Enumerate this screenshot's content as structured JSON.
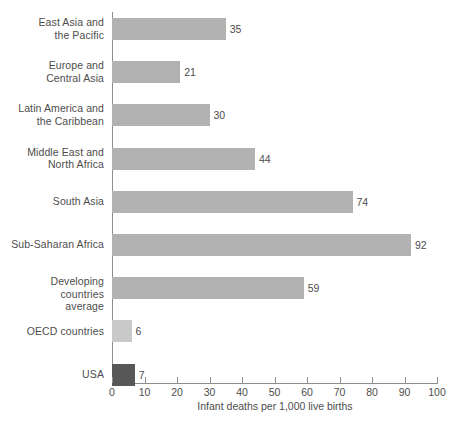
{
  "chart_data": {
    "type": "bar",
    "orientation": "horizontal",
    "title": "",
    "xlabel": "Infant deaths per 1,000 live births",
    "ylabel": "",
    "xlim": [
      0,
      100
    ],
    "xticks": [
      0,
      10,
      20,
      30,
      40,
      50,
      60,
      70,
      80,
      90,
      100
    ],
    "xtick_labels": [
      "0",
      "10",
      "20",
      "30",
      "40",
      "50",
      "60",
      "70",
      "80",
      "90",
      "100"
    ],
    "grid": false,
    "legend": null,
    "categories": [
      "East Asia and the Pacific",
      "Europe and Central Asia",
      "Latin America and the Caribbean",
      "Middle East and North Africa",
      "South Asia",
      "Sub-Saharan Africa",
      "Developing countries average",
      "OECD countries",
      "USA"
    ],
    "values": [
      35,
      21,
      30,
      44,
      74,
      92,
      59,
      6,
      7
    ],
    "value_labels": [
      "35",
      "21",
      "30",
      "44",
      "74",
      "92",
      "59",
      "6",
      "7"
    ],
    "bars": [
      {
        "label_line1": "East Asia and",
        "label_line2": "the Pacific",
        "value": 35,
        "value_label": "35",
        "color": "#b2b2b2"
      },
      {
        "label_line1": "Europe and",
        "label_line2": "Central Asia",
        "value": 21,
        "value_label": "21",
        "color": "#b2b2b2"
      },
      {
        "label_line1": "Latin America and",
        "label_line2": "the Caribbean",
        "value": 30,
        "value_label": "30",
        "color": "#b2b2b2"
      },
      {
        "label_line1": "Middle East and",
        "label_line2": "North Africa",
        "value": 44,
        "value_label": "44",
        "color": "#b2b2b2"
      },
      {
        "label_line1": "South Asia",
        "label_line2": "",
        "value": 74,
        "value_label": "74",
        "color": "#b2b2b2"
      },
      {
        "label_line1": "Sub-Saharan Africa",
        "label_line2": "",
        "value": 92,
        "value_label": "92",
        "color": "#b2b2b2"
      },
      {
        "label_line1": "Developing countries",
        "label_line2": "average",
        "value": 59,
        "value_label": "59",
        "color": "#b2b2b2"
      },
      {
        "label_line1": "OECD countries",
        "label_line2": "",
        "value": 6,
        "value_label": "6",
        "color": "#c9c9c9"
      },
      {
        "label_line1": "USA",
        "label_line2": "",
        "value": 7,
        "value_label": "7",
        "color": "#585858"
      }
    ],
    "colors": {
      "bar_default": "#b2b2b2",
      "bar_oecd": "#c9c9c9",
      "bar_usa": "#585858",
      "axis": "#8e8e8e",
      "text": "#4d4d4d",
      "background": "#ffffff"
    }
  }
}
